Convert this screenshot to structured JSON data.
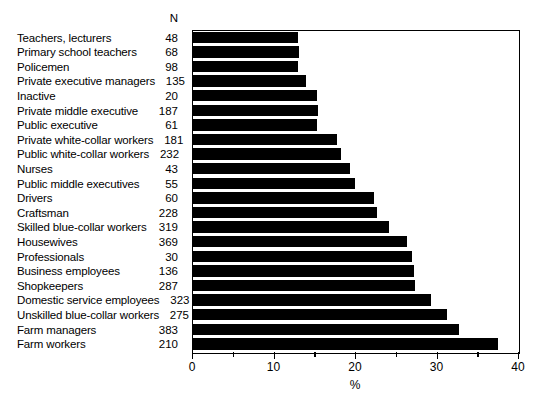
{
  "chart_data": {
    "type": "bar",
    "orientation": "horizontal",
    "title": "",
    "xlabel": "%",
    "ylabel": "",
    "xlim": [
      0,
      40
    ],
    "xticks": [
      0,
      5,
      10,
      15,
      20,
      25,
      30,
      35,
      40
    ],
    "xtick_labels": [
      "0",
      "",
      "10",
      "",
      "20",
      "",
      "30",
      "",
      "40"
    ],
    "grid": false,
    "legend": null,
    "n_column_header": "N",
    "categories": [
      "Teachers, lecturers",
      "Primary school teachers",
      "Policemen",
      "Private executive managers",
      "Inactive",
      "Private middle executive",
      "Public executive",
      "Private white-collar workers",
      "Public white-collar workers",
      "Nurses",
      "Public middle executives",
      "Drivers",
      "Craftsman",
      "Skilled blue-collar workers",
      "Housewives",
      "Professionals",
      "Business employees",
      "Shopkeepers",
      "Domestic service employees",
      "Unskilled blue-collar workers",
      "Farm managers",
      "Farm workers"
    ],
    "n_values": [
      48,
      68,
      98,
      135,
      20,
      187,
      61,
      181,
      232,
      43,
      55,
      60,
      228,
      319,
      369,
      30,
      136,
      287,
      323,
      275,
      383,
      210
    ],
    "values": [
      12.9,
      13.0,
      12.9,
      13.9,
      15.2,
      15.3,
      15.2,
      17.7,
      18.2,
      19.3,
      19.9,
      22.2,
      22.6,
      24.1,
      26.3,
      26.9,
      27.1,
      27.3,
      29.2,
      31.2,
      32.6,
      37.4
    ]
  }
}
